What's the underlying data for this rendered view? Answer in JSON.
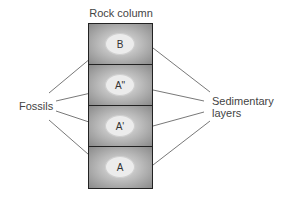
{
  "diagram": {
    "title": "Rock column",
    "layers": [
      {
        "fossil": "B"
      },
      {
        "fossil": "A\""
      },
      {
        "fossil": "A'"
      },
      {
        "fossil": "A"
      }
    ],
    "left_label": "Fossils",
    "right_label_line1": "Sedimentary",
    "right_label_line2": "layers"
  }
}
